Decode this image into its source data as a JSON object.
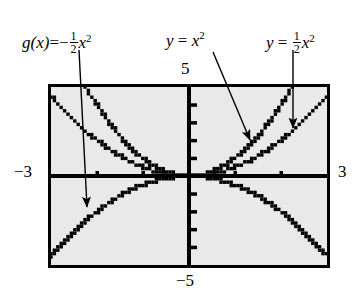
{
  "figure": {
    "kind": "graphing-calculator-screen"
  },
  "labels": {
    "left": {
      "fn": "g(x)",
      "eq": "=",
      "sign": "−",
      "numerator": "1",
      "denominator": "2",
      "variable": "x",
      "exponent": "2",
      "plain": "g(x) = -1/2 x^2"
    },
    "middle": {
      "fn": "y",
      "eq": "=",
      "variable": "x",
      "exponent": "2",
      "plain": "y = x^2"
    },
    "right": {
      "fn": "y",
      "eq": "=",
      "numerator": "1",
      "denominator": "2",
      "variable": "x",
      "exponent": "2",
      "plain": "y = 1/2 x^2"
    }
  },
  "window_labels": {
    "ymax": "5",
    "ymin": "−5",
    "xmin": "−3",
    "xmax": "3"
  },
  "colors": {
    "screen_background": "#e9e9e9",
    "ink": "#000000",
    "page_background": "#ffffff"
  },
  "chart_data": {
    "type": "line",
    "title": "",
    "xlabel": "",
    "ylabel": "",
    "xlim": [
      -3,
      3
    ],
    "ylim": [
      -5,
      5
    ],
    "grid": false,
    "legend": "annotations-with-leader-arrows",
    "axis_ticks": {
      "x": [
        -2,
        -1,
        1,
        2
      ],
      "y": [
        -4,
        -3,
        -2,
        -1,
        1,
        2,
        3,
        4
      ]
    },
    "series": [
      {
        "name": "y = x^2",
        "expression": "x^2",
        "coefficient": 1,
        "opens": "up",
        "x": [
          -3,
          -2.5,
          -2.236,
          -2,
          -1.5,
          -1,
          -0.5,
          0,
          0.5,
          1,
          1.5,
          2,
          2.236,
          2.5,
          3
        ],
        "y": [
          9,
          6.25,
          5,
          4,
          2.25,
          1,
          0.25,
          0,
          0.25,
          1,
          2.25,
          4,
          5,
          6.25,
          9
        ]
      },
      {
        "name": "y = 1/2 x^2",
        "expression": "0.5*x^2",
        "coefficient": 0.5,
        "opens": "up",
        "x": [
          -3,
          -2.5,
          -2,
          -1.5,
          -1,
          -0.5,
          0,
          0.5,
          1,
          1.5,
          2,
          2.5,
          3
        ],
        "y": [
          4.5,
          3.125,
          2,
          1.125,
          0.5,
          0.125,
          0,
          0.125,
          0.5,
          1.125,
          2,
          3.125,
          4.5
        ]
      },
      {
        "name": "g(x) = -1/2 x^2",
        "expression": "-0.5*x^2",
        "coefficient": -0.5,
        "opens": "down",
        "x": [
          -3,
          -2.5,
          -2,
          -1.5,
          -1,
          -0.5,
          0,
          0.5,
          1,
          1.5,
          2,
          2.5,
          3
        ],
        "y": [
          -4.5,
          -3.125,
          -2,
          -1.125,
          -0.5,
          -0.125,
          0,
          -0.125,
          -0.5,
          -1.125,
          -2,
          -3.125,
          -4.5
        ]
      }
    ],
    "annotations": [
      {
        "text": "g(x) = -1/2 x^2",
        "points_to": "downward parabola, lower-left branch"
      },
      {
        "text": "y = x^2",
        "points_to": "steeper upward parabola, right branch"
      },
      {
        "text": "y = 1/2 x^2",
        "points_to": "shallower upward parabola, right branch"
      }
    ]
  }
}
